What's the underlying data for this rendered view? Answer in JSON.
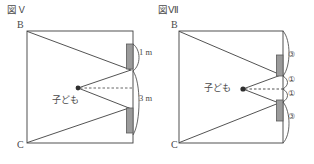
{
  "figures": [
    {
      "id": "fig-left",
      "caption": "図Ｖ",
      "vertices": {
        "top": "B",
        "bottom": "C"
      },
      "person_label": "子ども",
      "dimensions": [
        {
          "label": "1 m",
          "position": "upper-right"
        },
        {
          "label": "3 m",
          "position": "lower-right"
        }
      ],
      "mirrors": 2,
      "wall": "right"
    },
    {
      "id": "fig-right",
      "caption": "図Ⅶ",
      "vertices": {
        "top": "B",
        "bottom": "C"
      },
      "person_label": "子ども",
      "segments": [
        {
          "label": "③",
          "position": "top"
        },
        {
          "label": "①",
          "position": "upper-mid"
        },
        {
          "label": "①",
          "position": "lower-mid"
        },
        {
          "label": "③",
          "position": "bottom"
        }
      ],
      "mirrors": 2,
      "wall": "right"
    }
  ],
  "colors": {
    "stroke": "#3f3f3f",
    "mirror_fill": "#9b9b9b",
    "mirror_stroke": "#5a5a5a",
    "text": "#4a4a4a",
    "background": "#ffffff"
  }
}
